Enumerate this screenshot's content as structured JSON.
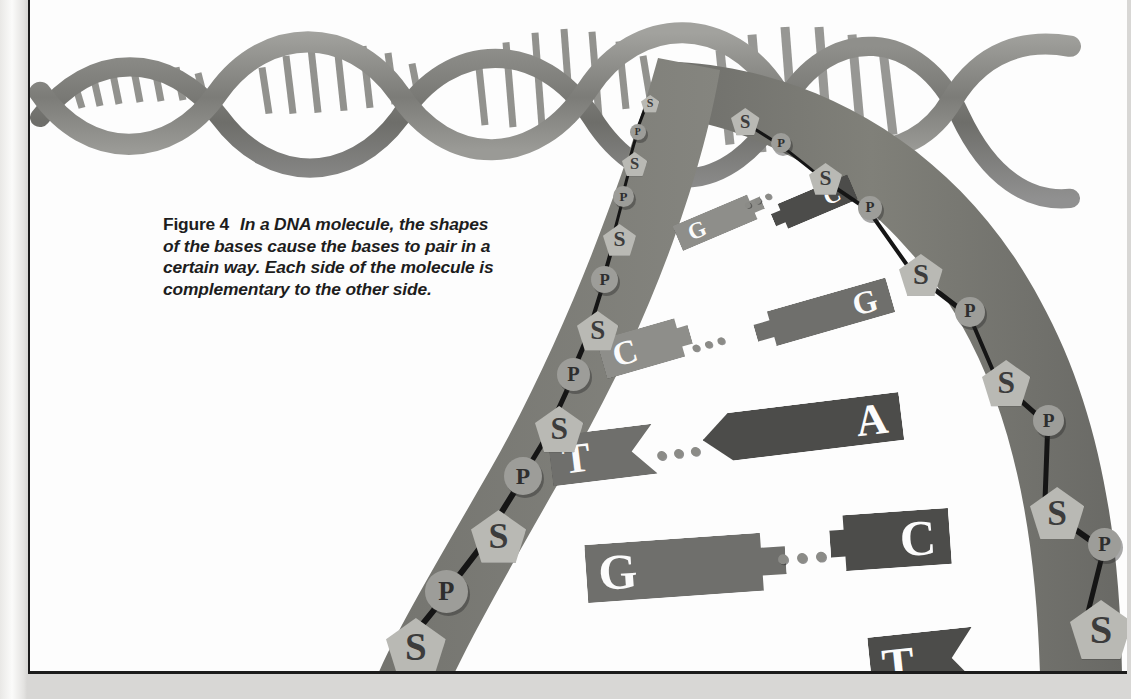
{
  "figure": {
    "label": "Figure 4",
    "caption": "In a DNA molecule, the shapes of the bases cause the bases to pair in a certain way. Each side of the molecule is complementary to the other side."
  },
  "colors": {
    "page_background": "#fdfdfd",
    "paper_edge": "#e3e2e0",
    "frame_border": "#1b1b1b",
    "backbone_ribbon": "#7a7a76",
    "sugar_fill": "#b9b9b4",
    "phosphate_fill": "#9d9d99",
    "base_light": "#8e8e8a",
    "base_mid": "#6f6f6c",
    "base_dark": "#4c4c4a",
    "hydrogen_bond_dot": "#8b8b87",
    "bond_line": "#151515",
    "letter_dark": "#3c3c3c",
    "letter_light": "#fafafa"
  },
  "legend": {
    "sugar_symbol": "S",
    "phosphate_symbol": "P",
    "sugar_name": "sugar",
    "phosphate_name": "phosphate"
  },
  "chart_data": {
    "type": "diagram",
    "base_pairs": [
      {
        "left": "G",
        "right": "C",
        "bond_dots": 3,
        "row": 1
      },
      {
        "left": "C",
        "right": "G",
        "bond_dots": 3,
        "row": 2
      },
      {
        "left": "T",
        "right": "A",
        "bond_dots": 3,
        "row": 3
      },
      {
        "left": "G",
        "right": "C",
        "bond_dots": 3,
        "row": 4
      },
      {
        "left": "T",
        "right": "S",
        "bond_dots": 0,
        "row": 5
      }
    ],
    "pairing_rules": [
      "A pairs with T",
      "G pairs with C"
    ],
    "left_backbone_sequence": [
      "S",
      "P",
      "S",
      "P",
      "S",
      "P",
      "S",
      "P",
      "S",
      "P",
      "S",
      "P"
    ],
    "right_backbone_sequence": [
      "S",
      "P",
      "S",
      "P",
      "S",
      "P",
      "S",
      "P",
      "S"
    ]
  },
  "left_backbone": [
    {
      "type": "S",
      "x": 611,
      "y": 95,
      "scale": 0.4
    },
    {
      "type": "P",
      "x": 600,
      "y": 124,
      "scale": 0.46
    },
    {
      "type": "S",
      "x": 592,
      "y": 152,
      "scale": 0.55
    },
    {
      "type": "P",
      "x": 583,
      "y": 186,
      "scale": 0.62
    },
    {
      "type": "S",
      "x": 573,
      "y": 224,
      "scale": 0.72
    },
    {
      "type": "P",
      "x": 561,
      "y": 266,
      "scale": 0.8
    },
    {
      "type": "S",
      "x": 547,
      "y": 311,
      "scale": 0.9
    },
    {
      "type": "P",
      "x": 527,
      "y": 358,
      "scale": 0.97
    },
    {
      "type": "S",
      "x": 505,
      "y": 406,
      "scale": 1.05
    },
    {
      "type": "P",
      "x": 474,
      "y": 457,
      "scale": 1.12
    },
    {
      "type": "S",
      "x": 441,
      "y": 510,
      "scale": 1.2
    },
    {
      "type": "P",
      "x": 395,
      "y": 570,
      "scale": 1.26
    },
    {
      "type": "S",
      "x": 356,
      "y": 618,
      "scale": 1.3
    }
  ],
  "right_backbone": [
    {
      "type": "S",
      "x": 701,
      "y": 108,
      "scale": 0.62
    },
    {
      "type": "P",
      "x": 741,
      "y": 133,
      "scale": 0.6
    },
    {
      "type": "S",
      "x": 779,
      "y": 163,
      "scale": 0.72
    },
    {
      "type": "P",
      "x": 828,
      "y": 196,
      "scale": 0.7
    },
    {
      "type": "S",
      "x": 869,
      "y": 254,
      "scale": 0.95
    },
    {
      "type": "P",
      "x": 925,
      "y": 297,
      "scale": 0.88
    },
    {
      "type": "S",
      "x": 952,
      "y": 360,
      "scale": 1.05
    },
    {
      "type": "P",
      "x": 1003,
      "y": 405,
      "scale": 0.92
    },
    {
      "type": "S",
      "x": 1000,
      "y": 487,
      "scale": 1.18
    },
    {
      "type": "P",
      "x": 1058,
      "y": 528,
      "scale": 0.98
    },
    {
      "type": "S",
      "x": 1040,
      "y": 600,
      "scale": 1.35
    }
  ],
  "bases": [
    {
      "letter": "G",
      "side": "left",
      "x": 644,
      "y": 207,
      "w": 92,
      "h": 27,
      "rot": -23,
      "tone": "light",
      "fs": 23
    },
    {
      "letter": "C",
      "side": "right",
      "x": 740,
      "y": 190,
      "w": 86,
      "h": 27,
      "rot": -23,
      "tone": "dark",
      "fs": 23
    },
    {
      "letter": "C",
      "side": "left",
      "x": 570,
      "y": 327,
      "w": 92,
      "h": 40,
      "rot": -16,
      "tone": "light",
      "fs": 34
    },
    {
      "letter": "G",
      "side": "right",
      "x": 723,
      "y": 296,
      "w": 140,
      "h": 36,
      "rot": -16,
      "tone": "mid",
      "fs": 32
    },
    {
      "letter": "T",
      "side": "left",
      "x": 520,
      "y": 430,
      "w": 105,
      "h": 50,
      "rot": -7,
      "tone": "mid",
      "fs": 42
    },
    {
      "letter": "A",
      "side": "right",
      "x": 672,
      "y": 404,
      "w": 200,
      "h": 48,
      "rot": -7,
      "tone": "dark",
      "fs": 44
    },
    {
      "letter": "G",
      "side": "left",
      "x": 556,
      "y": 538,
      "w": 200,
      "h": 58,
      "rot": -4,
      "tone": "mid",
      "fs": 50
    },
    {
      "letter": "C",
      "side": "right",
      "x": 800,
      "y": 512,
      "w": 120,
      "h": 56,
      "rot": -4,
      "tone": "dark",
      "fs": 50
    },
    {
      "letter": "T",
      "side": "left",
      "x": 840,
      "y": 632,
      "w": 105,
      "h": 58,
      "rot": -6,
      "tone": "dark",
      "fs": 48
    }
  ],
  "hydrogen_bonds": [
    {
      "x": 714,
      "y": 198,
      "rot": -23,
      "dots": 3,
      "size": 6
    },
    {
      "x": 662,
      "y": 341,
      "rot": -16,
      "dots": 3,
      "size": 7
    },
    {
      "x": 627,
      "y": 449,
      "rot": -7,
      "dots": 3,
      "size": 9
    },
    {
      "x": 748,
      "y": 553,
      "rot": -4,
      "dots": 3,
      "size": 10
    }
  ]
}
